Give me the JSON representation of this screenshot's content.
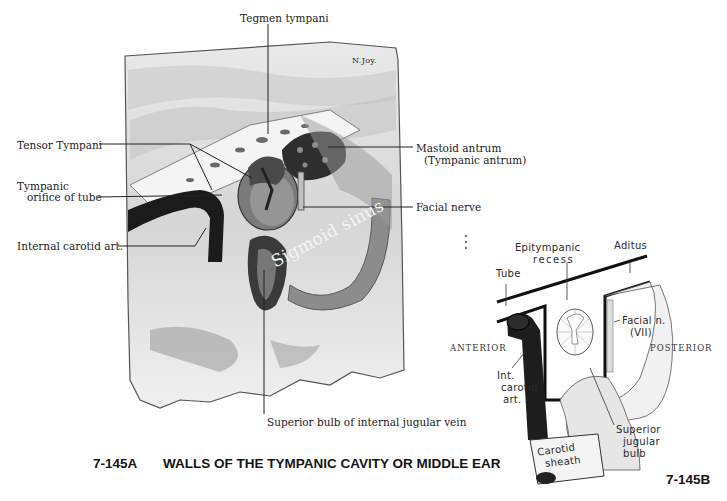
{
  "figure_a": {
    "caption_id": "7-145A",
    "caption_title": "WALLS OF THE TYMPANIC CAVITY OR MIDDLE EAR",
    "signature": "N.Joy.",
    "labels": {
      "tegmen_tympani": "Tegmen tympani",
      "tensor_tympani": "Tensor Tympani",
      "tympanic_orifice_line1": "Tympanic",
      "tympanic_orifice_line2": "orifice of tube",
      "internal_carotid": "Internal carotid art.",
      "mastoid_antrum_line1": "Mastoid antrum",
      "mastoid_antrum_line2": "(Tympanic antrum)",
      "facial_nerve": "Facial nerve",
      "superior_bulb": "Superior bulb of internal jugular vein",
      "sigmoid_sinus": "Sigmoid sinus"
    }
  },
  "figure_b": {
    "caption_id": "7-145B",
    "labels": {
      "epitympanic_line1": "Epitympanic",
      "epitympanic_line2": "recess",
      "aditus": "Aditus",
      "tube": "Tube",
      "facial_line1": "Facial n.",
      "facial_line2": "(VII)",
      "anterior": "ANTERIOR",
      "posterior": "POSTERIOR",
      "int_carotid_line1": "Int.",
      "int_carotid_line2": "carotid",
      "int_carotid_line3": "art.",
      "superior_jugular_line1": "Superior",
      "superior_jugular_line2": "jugular",
      "superior_jugular_line3": "bulb",
      "carotid_sheath_line1": "Carotid",
      "carotid_sheath_line2": "sheath"
    }
  }
}
